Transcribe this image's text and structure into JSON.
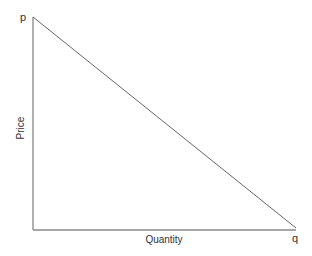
{
  "diagram": {
    "type": "demand-curve",
    "y_axis_label": "Price",
    "x_axis_label": "Quantity",
    "y_intercept_label": "p",
    "x_intercept_label": "q",
    "colors": {
      "axis": "#888888",
      "line": "#666666",
      "text": "#333333",
      "background": "#ffffff"
    }
  }
}
